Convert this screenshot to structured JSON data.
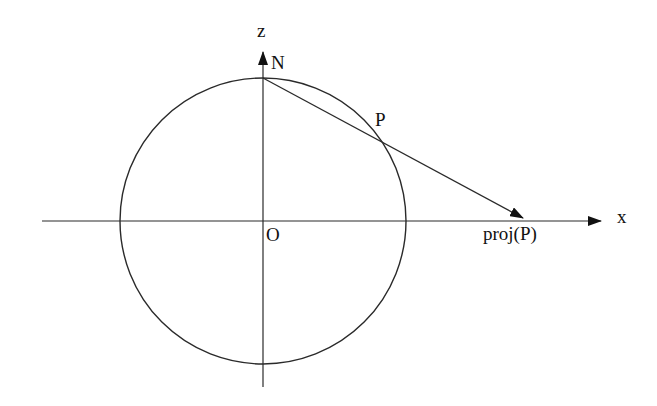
{
  "diagram": {
    "colors": {
      "stroke": "#2a2a2a",
      "text": "#111111",
      "background": "#ffffff"
    },
    "labels": {
      "z_axis": "z",
      "x_axis": "x",
      "north_pole": "N",
      "point": "P",
      "origin": "O",
      "projection": "proj(P)"
    },
    "geometry": {
      "circle_center": [
        263,
        221
      ],
      "circle_radius": 143,
      "x_axis": {
        "from": [
          42,
          221
        ],
        "to": [
          603,
          221
        ]
      },
      "z_axis": {
        "from": [
          263,
          387
        ],
        "to": [
          263,
          50
        ]
      },
      "north_pole": [
        263,
        78
      ],
      "point_P": [
        384,
        143
      ],
      "projection": [
        525,
        219
      ]
    }
  }
}
